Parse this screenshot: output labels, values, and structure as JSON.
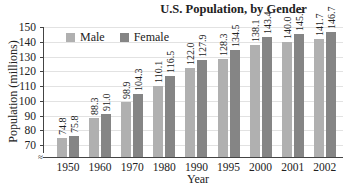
{
  "chart_data": {
    "type": "bar",
    "title": "U.S. Population, by Gender",
    "xlabel": "Year",
    "ylabel": "Population (millions)",
    "ylim": [
      65,
      150
    ],
    "yticks": [
      70,
      80,
      90,
      100,
      110,
      120,
      130,
      140,
      150
    ],
    "grid": true,
    "legend_position": "top-left",
    "categories": [
      "1950",
      "1960",
      "1970",
      "1980",
      "1990",
      "1995",
      "2000",
      "2001",
      "2002"
    ],
    "series": [
      {
        "name": "Male",
        "color": "#b0b0b0",
        "values": [
          74.8,
          88.3,
          98.9,
          110.1,
          122.0,
          128.3,
          138.1,
          140.0,
          141.7
        ]
      },
      {
        "name": "Female",
        "color": "#858585",
        "values": [
          75.8,
          91.0,
          104.3,
          116.5,
          127.9,
          134.5,
          143.4,
          145.0,
          146.7
        ]
      }
    ],
    "value_labels": {
      "male": [
        "74.8",
        "88.3",
        "98.9",
        "110.1",
        "122.0",
        "128.3",
        "138.1",
        "140.0",
        "141.7"
      ],
      "female": [
        "75.8",
        "91.0",
        "104.3",
        "116.5",
        "127.9",
        "134.5",
        "143.4",
        "145.0",
        "146.7"
      ]
    }
  },
  "legend": {
    "male": "Male",
    "female": "Female"
  },
  "ytick_labels": [
    "70",
    "80",
    "90",
    "100",
    "110",
    "120",
    "130",
    "140",
    "150"
  ]
}
